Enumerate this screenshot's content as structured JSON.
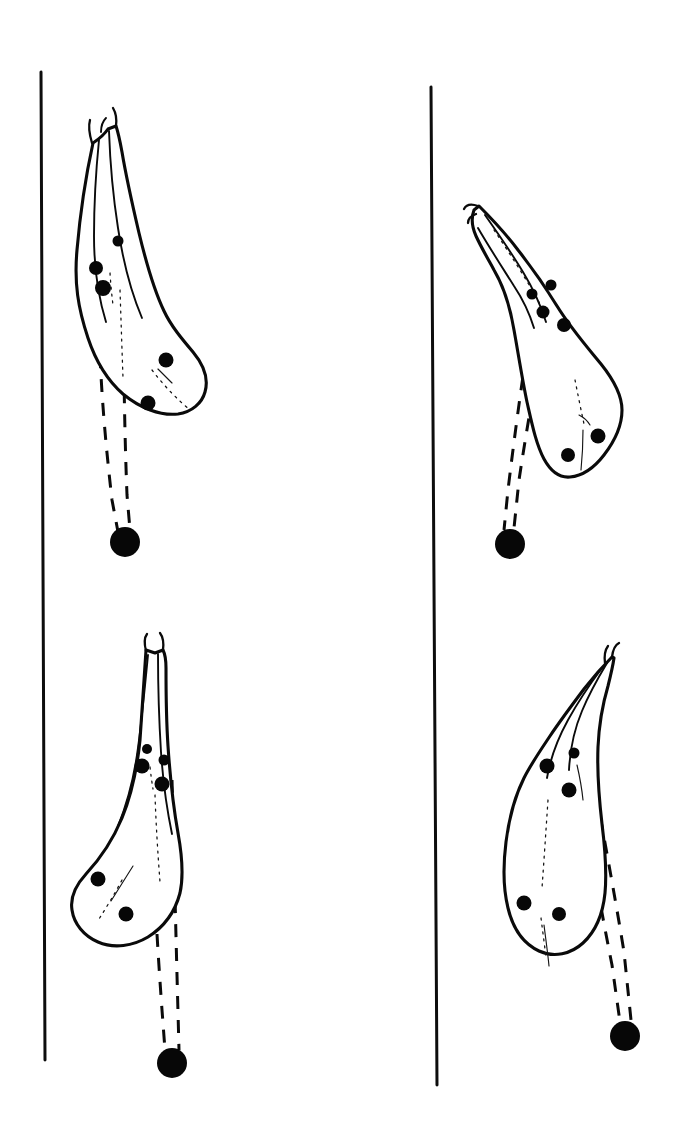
{
  "plate": {
    "title": "Parasitic copepod specimens plate",
    "background_color": "#ffffff",
    "ink_color": "#0a0a0a",
    "width": 682,
    "height": 1125,
    "style": "black ink line drawing",
    "panel_count": 4,
    "layout": "2 columns x 2 rows separated by vertical rules"
  },
  "rules": [
    {
      "name": "left-vertical-rule",
      "x1": 41,
      "y1": 72,
      "x2": 45,
      "y2": 1060,
      "stroke_width": 3.0
    },
    {
      "name": "right-vertical-rule",
      "x1": 431,
      "y1": 87,
      "x2": 437,
      "y2": 1085,
      "stroke_width": 3.0
    }
  ],
  "specimens": [
    {
      "id": "specimen-top-left",
      "panel": "top-left",
      "orientation": "head up, body curving down-right, egg strings trailing straight down",
      "head_tip": [
        105,
        122
      ],
      "anchor_dot": {
        "cx": 125,
        "cy": 542,
        "r": 15
      },
      "spot_count": 5,
      "spots": [
        {
          "cx": 96,
          "cy": 268,
          "r": 7.0
        },
        {
          "cx": 118,
          "cy": 241,
          "r": 5.5
        },
        {
          "cx": 103,
          "cy": 288,
          "r": 8.0
        },
        {
          "cx": 166,
          "cy": 360,
          "r": 7.5
        },
        {
          "cx": 148,
          "cy": 403,
          "r": 7.5
        }
      ],
      "egg_string_count": 2
    },
    {
      "id": "specimen-top-right",
      "panel": "top-right",
      "orientation": "head up-left, body curving down-right, egg strings trailing down-left",
      "head_tip": [
        477,
        205
      ],
      "anchor_dot": {
        "cx": 510,
        "cy": 544,
        "r": 15
      },
      "spot_count": 5,
      "spots": [
        {
          "cx": 532,
          "cy": 294,
          "r": 5.5
        },
        {
          "cx": 551,
          "cy": 285,
          "r": 5.5
        },
        {
          "cx": 543,
          "cy": 312,
          "r": 6.5
        },
        {
          "cx": 564,
          "cy": 325,
          "r": 7.0
        },
        {
          "cx": 598,
          "cy": 436,
          "r": 7.5
        },
        {
          "cx": 568,
          "cy": 455,
          "r": 7.0
        }
      ],
      "egg_string_count": 2
    },
    {
      "id": "specimen-bottom-left",
      "panel": "bottom-left",
      "orientation": "head up, body curving down-left, egg strings trailing straight down",
      "head_tip": [
        152,
        648
      ],
      "anchor_dot": {
        "cx": 172,
        "cy": 1063,
        "r": 15
      },
      "spot_count": 5,
      "spots": [
        {
          "cx": 147,
          "cy": 749,
          "r": 5.0
        },
        {
          "cx": 142,
          "cy": 766,
          "r": 7.5
        },
        {
          "cx": 164,
          "cy": 760,
          "r": 5.5
        },
        {
          "cx": 162,
          "cy": 784,
          "r": 7.5
        },
        {
          "cx": 98,
          "cy": 879,
          "r": 7.5
        },
        {
          "cx": 126,
          "cy": 914,
          "r": 7.5
        }
      ],
      "egg_string_count": 2
    },
    {
      "id": "specimen-bottom-right",
      "panel": "bottom-right",
      "orientation": "head up-right, body curving down-left, egg strings trailing down-right",
      "head_tip": [
        614,
        655
      ],
      "anchor_dot": {
        "cx": 625,
        "cy": 1036,
        "r": 15
      },
      "spot_count": 5,
      "spots": [
        {
          "cx": 547,
          "cy": 766,
          "r": 7.5
        },
        {
          "cx": 574,
          "cy": 753,
          "r": 5.5
        },
        {
          "cx": 569,
          "cy": 790,
          "r": 7.5
        },
        {
          "cx": 524,
          "cy": 903,
          "r": 7.5
        },
        {
          "cx": 559,
          "cy": 914,
          "r": 7.0
        }
      ],
      "egg_string_count": 2
    }
  ]
}
